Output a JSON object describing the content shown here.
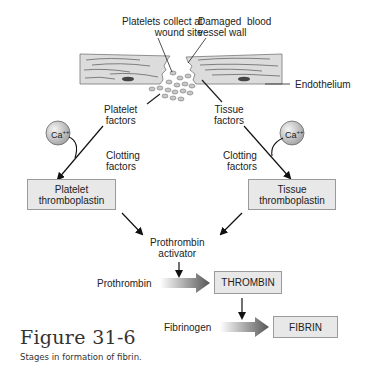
{
  "diagram": {
    "labels": {
      "platelets_collect": [
        "Platelets collect at",
        "wound site"
      ],
      "damaged_vessel": [
        "Damaged  blood",
        "vessel wall"
      ],
      "endothelium": "Endothelium",
      "platelet_factors": [
        "Platelet",
        "factors"
      ],
      "tissue_factors": [
        "Tissue",
        "factors"
      ],
      "clotting_factors_left": [
        "Clotting",
        "factors"
      ],
      "clotting_factors_right": [
        "Clotting",
        "factors"
      ],
      "calcium_left": "Ca",
      "calcium_right": "Ca",
      "calcium_superscript": "++",
      "prothrombin_activator": [
        "Prothrombin",
        "activator"
      ],
      "prothrombin": "Prothrombin",
      "fibrinogen": "Fibrinogen"
    },
    "boxes": {
      "platelet_thromboplastin": [
        "Platelet",
        "thromboplastin"
      ],
      "tissue_thromboplastin": [
        "Tissue",
        "thromboplastin"
      ],
      "thrombin": "THROMBIN",
      "fibrin": "FIBRIN"
    },
    "colors": {
      "box_fill": "#e8e8e8",
      "vessel_fill": "#dcdcdc",
      "platelet_fill": "#c8c8c8",
      "arrow_dark": "#5a5a5a"
    }
  },
  "figure": {
    "title": "Figure 31-6",
    "caption": "Stages in formation of fibrin."
  }
}
